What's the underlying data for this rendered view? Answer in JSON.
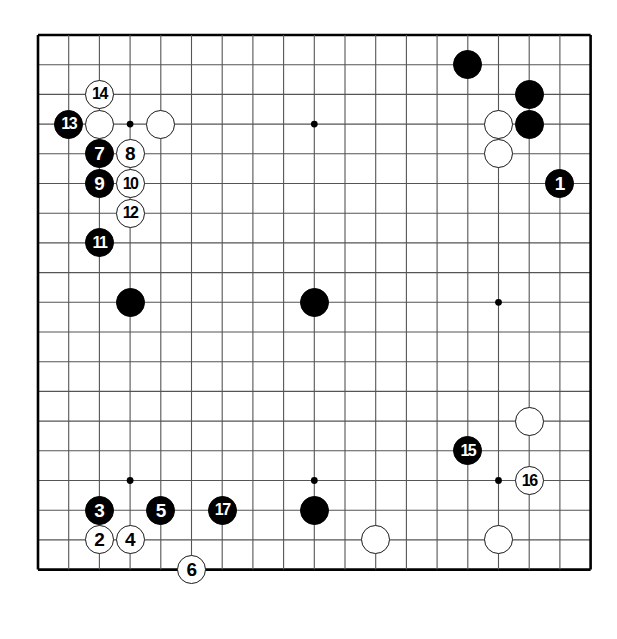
{
  "figure": {
    "type": "go-board-diagram"
  },
  "board": {
    "size": 19,
    "visible_columns": 19,
    "visible_rows": 19,
    "origin_x": 38,
    "origin_y": 35,
    "spacing_x": 30.7,
    "spacing_y": 29.7,
    "line_color": "#555555",
    "border_color": "#000000",
    "background_color": "#ffffff",
    "star_point_color": "#000000",
    "star_points": [
      {
        "col": 3,
        "row": 3
      },
      {
        "col": 9,
        "row": 3
      },
      {
        "col": 15,
        "row": 3
      },
      {
        "col": 3,
        "row": 9
      },
      {
        "col": 9,
        "row": 9
      },
      {
        "col": 15,
        "row": 9
      },
      {
        "col": 3,
        "row": 15
      },
      {
        "col": 9,
        "row": 15
      },
      {
        "col": 15,
        "row": 15
      }
    ]
  },
  "stones": [
    {
      "label": "1",
      "color": "black",
      "col": 17,
      "row": 5
    },
    {
      "label": "2",
      "color": "white",
      "col": 2,
      "row": 17
    },
    {
      "label": "3",
      "color": "black",
      "col": 2,
      "row": 16
    },
    {
      "label": "4",
      "color": "white",
      "col": 3,
      "row": 17
    },
    {
      "label": "5",
      "color": "black",
      "col": 4,
      "row": 16
    },
    {
      "label": "6",
      "color": "white",
      "col": 5,
      "row": 18
    },
    {
      "label": "7",
      "color": "black",
      "col": 2,
      "row": 4
    },
    {
      "label": "8",
      "color": "white",
      "col": 3,
      "row": 4
    },
    {
      "label": "9",
      "color": "black",
      "col": 2,
      "row": 5
    },
    {
      "label": "10",
      "color": "white",
      "col": 3,
      "row": 5
    },
    {
      "label": "11",
      "color": "black",
      "col": 2,
      "row": 7
    },
    {
      "label": "12",
      "color": "white",
      "col": 3,
      "row": 6
    },
    {
      "label": "13",
      "color": "black",
      "col": 1,
      "row": 3
    },
    {
      "label": "14",
      "color": "white",
      "col": 2,
      "row": 2
    },
    {
      "label": "15",
      "color": "black",
      "col": 14,
      "row": 14
    },
    {
      "label": "16",
      "color": "white",
      "col": 16,
      "row": 15
    },
    {
      "label": "17",
      "color": "black",
      "col": 6,
      "row": 16
    }
  ],
  "plain_stones": [
    {
      "color": "black",
      "col": 14,
      "row": 1
    },
    {
      "color": "black",
      "col": 16,
      "row": 2
    },
    {
      "color": "black",
      "col": 16,
      "row": 3
    },
    {
      "color": "white",
      "col": 15,
      "row": 3
    },
    {
      "color": "white",
      "col": 15,
      "row": 4
    },
    {
      "color": "white",
      "col": 2,
      "row": 3
    },
    {
      "color": "white",
      "col": 4,
      "row": 3
    },
    {
      "color": "black",
      "col": 3,
      "row": 9
    },
    {
      "color": "black",
      "col": 9,
      "row": 9
    },
    {
      "color": "white",
      "col": 16,
      "row": 13
    },
    {
      "color": "black",
      "col": 9,
      "row": 16
    },
    {
      "color": "white",
      "col": 11,
      "row": 17
    },
    {
      "color": "white",
      "col": 15,
      "row": 17
    }
  ]
}
